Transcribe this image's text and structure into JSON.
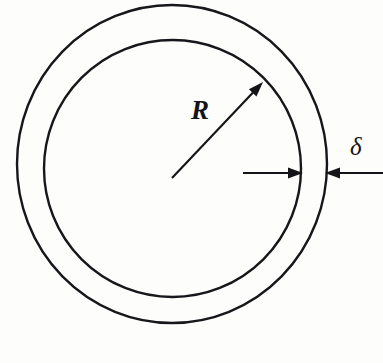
{
  "figure": {
    "kind": "annulus-cross-section-diagram",
    "background_color": "#fdfdfc",
    "ink_color": "#141317",
    "width": 383,
    "height": 363
  },
  "labels": {
    "radius": "R",
    "thickness": "δ"
  },
  "geometry": {
    "outer_circle": {
      "cx": 172,
      "cy": 164,
      "rx": 155,
      "ry": 159,
      "stroke_width": 2.4
    },
    "inner_circle": {
      "cx": 172.5,
      "cy": 168.5,
      "rx": 128.5,
      "ry": 128.5,
      "stroke_width": 2.4
    },
    "radius_arrow": {
      "x1": 172,
      "y1": 178,
      "x2": 263,
      "y2": 82
    },
    "thickness_arrow_inward": {
      "x1": 243,
      "y1": 173,
      "x2": 303,
      "y2": 173
    },
    "thickness_arrow_outward": {
      "x1": 383,
      "y1": 173,
      "x2": 325,
      "y2": 173
    }
  },
  "chart_data": {
    "type": "diagram",
    "title": "",
    "annotations": [
      {
        "name": "R",
        "meaning": "mean radius of the ring",
        "anchor": "center-to-inner-circle"
      },
      {
        "name": "δ",
        "meaning": "wall thickness of the ring",
        "anchor": "between-inner-and-outer-circle"
      }
    ]
  }
}
